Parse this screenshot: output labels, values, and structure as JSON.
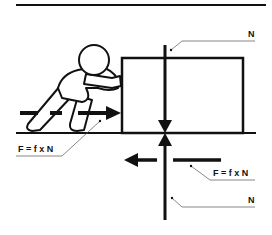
{
  "diagram": {
    "labels": {
      "normal_top": "N",
      "friction_push": "F = f x N",
      "friction_ground": "F = f x N",
      "normal_bottom": "N"
    },
    "colors": {
      "stroke": "#111111",
      "background": "#ffffff",
      "leader": "#555555"
    }
  }
}
